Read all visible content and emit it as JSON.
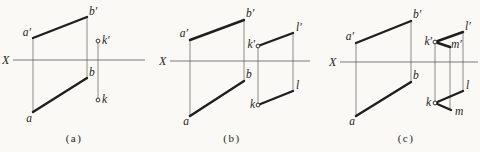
{
  "meta": {
    "background": "#faf9f5",
    "ink": "#1f1f1f",
    "thin_ink": "#5b5b5b",
    "width": 480,
    "height": 152
  },
  "figures": [
    {
      "id": "a",
      "caption": {
        "text": "(a)",
        "x": 74,
        "y": 142
      },
      "axis": {
        "label": "X",
        "label_x": 2,
        "label_y": 64,
        "x1": 13,
        "x2": 145,
        "y": 60
      },
      "thick_segments": [
        [
          33,
          38,
          87,
          17
        ],
        [
          33,
          112,
          87,
          78
        ]
      ],
      "thin_segments": [
        [
          33,
          38,
          33,
          112
        ],
        [
          87,
          17,
          87,
          78
        ],
        [
          98,
          43,
          98,
          98
        ]
      ],
      "markers": [
        [
          98,
          41
        ],
        [
          98,
          100
        ]
      ],
      "labels": [
        {
          "text": "a′",
          "x": 31,
          "y": 36,
          "anchor": "end"
        },
        {
          "text": "b′",
          "x": 89,
          "y": 15,
          "anchor": "start"
        },
        {
          "text": "b",
          "x": 89,
          "y": 76,
          "anchor": "start"
        },
        {
          "text": "a",
          "x": 29,
          "y": 122,
          "anchor": "middle"
        },
        {
          "text": "k′",
          "x": 102,
          "y": 44,
          "anchor": "start"
        },
        {
          "text": "k",
          "x": 102,
          "y": 103,
          "anchor": "start"
        }
      ]
    },
    {
      "id": "b",
      "caption": {
        "text": "(b)",
        "x": 232,
        "y": 142
      },
      "axis": {
        "label": "X",
        "label_x": 159,
        "label_y": 65,
        "x1": 170,
        "x2": 310,
        "y": 61
      },
      "thick_segments": [
        [
          190,
          40,
          244,
          20
        ],
        [
          190,
          116,
          244,
          81
        ],
        [
          258,
          46,
          293,
          33
        ],
        [
          258,
          105,
          293,
          91
        ]
      ],
      "thin_segments": [
        [
          190,
          40,
          190,
          116
        ],
        [
          244,
          20,
          244,
          81
        ],
        [
          258,
          48,
          258,
          103
        ],
        [
          293,
          33,
          293,
          91
        ]
      ],
      "markers": [
        [
          258,
          46
        ],
        [
          258,
          105
        ]
      ],
      "labels": [
        {
          "text": "a′",
          "x": 188,
          "y": 37,
          "anchor": "end"
        },
        {
          "text": "b′",
          "x": 246,
          "y": 17,
          "anchor": "start"
        },
        {
          "text": "b",
          "x": 246,
          "y": 78,
          "anchor": "start"
        },
        {
          "text": "a",
          "x": 186,
          "y": 125,
          "anchor": "middle"
        },
        {
          "text": "k′",
          "x": 255,
          "y": 48,
          "anchor": "end"
        },
        {
          "text": "l′",
          "x": 296,
          "y": 31,
          "anchor": "start"
        },
        {
          "text": "k",
          "x": 255,
          "y": 108,
          "anchor": "end"
        },
        {
          "text": "l",
          "x": 296,
          "y": 89,
          "anchor": "start"
        }
      ]
    },
    {
      "id": "c",
      "caption": {
        "text": "(c)",
        "x": 406,
        "y": 142
      },
      "axis": {
        "label": "X",
        "label_x": 329,
        "label_y": 66,
        "x1": 340,
        "x2": 478,
        "y": 62
      },
      "thick_segments": [
        [
          356,
          43,
          411,
          21
        ],
        [
          356,
          116,
          411,
          82
        ],
        [
          435,
          42,
          463,
          32
        ],
        [
          435,
          42,
          450,
          47
        ],
        [
          435,
          103,
          463,
          91
        ],
        [
          435,
          103,
          451,
          110
        ]
      ],
      "thin_segments": [
        [
          356,
          43,
          356,
          116
        ],
        [
          411,
          21,
          411,
          82
        ],
        [
          435,
          44,
          435,
          101
        ],
        [
          450,
          47,
          450,
          109
        ],
        [
          463,
          32,
          463,
          91
        ]
      ],
      "markers": [
        [
          435,
          42
        ],
        [
          435,
          103
        ]
      ],
      "labels": [
        {
          "text": "a′",
          "x": 354,
          "y": 40,
          "anchor": "end"
        },
        {
          "text": "b′",
          "x": 413,
          "y": 18,
          "anchor": "start"
        },
        {
          "text": "b",
          "x": 413,
          "y": 79,
          "anchor": "start"
        },
        {
          "text": "a",
          "x": 352,
          "y": 125,
          "anchor": "middle"
        },
        {
          "text": "k′",
          "x": 432,
          "y": 45,
          "anchor": "end"
        },
        {
          "text": "l′",
          "x": 465,
          "y": 30,
          "anchor": "start"
        },
        {
          "text": "m′",
          "x": 451,
          "y": 48,
          "anchor": "start"
        },
        {
          "text": "k",
          "x": 431,
          "y": 106,
          "anchor": "end"
        },
        {
          "text": "l",
          "x": 466,
          "y": 89,
          "anchor": "start"
        },
        {
          "text": "m",
          "x": 455,
          "y": 115,
          "anchor": "start"
        }
      ]
    }
  ]
}
